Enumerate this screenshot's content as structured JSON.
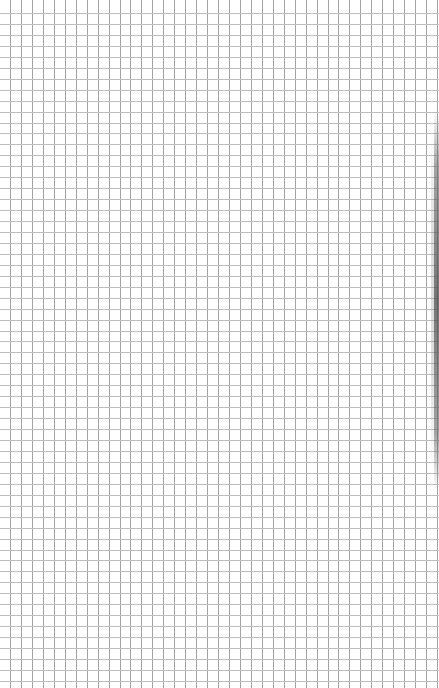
{
  "page": {
    "kind": "graph-paper",
    "width": 439,
    "height": 688,
    "background_color": "#ffffff"
  },
  "grid": {
    "cell_size": 10.95,
    "x_offset": 10,
    "y_offset": 13,
    "vertical_line_color": "#a3a3a3",
    "horizontal_line_color": "#bdbdbd",
    "line_width": 1
  },
  "edge_shadow": {
    "side": "right",
    "color": "#5a5a5a"
  }
}
